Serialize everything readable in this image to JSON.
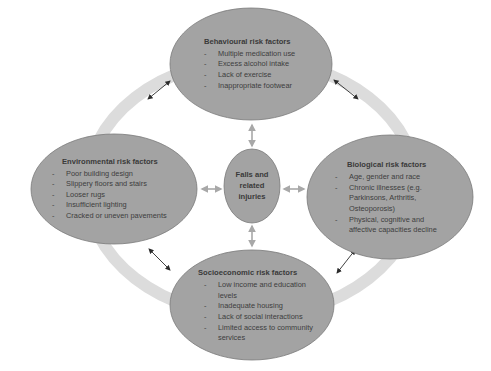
{
  "diagram": {
    "center": {
      "label_lines": [
        "Falls and",
        "related",
        "injuries"
      ]
    },
    "nodes": {
      "behavioural": {
        "title": "Behavioural risk factors",
        "items": [
          "Multiple medication use",
          "Excess alcohol intake",
          "Lack of exercise",
          "Inappropriate footwear"
        ]
      },
      "environmental": {
        "title": "Environmental risk factors",
        "items": [
          "Poor building design",
          "Slippery floors and stairs",
          "Looser rugs",
          "Insufficient lighting",
          "Cracked or uneven pavements"
        ]
      },
      "biological": {
        "title": "Biological risk factors",
        "items": [
          "Age, gender and race",
          "Chronic illnesses (e.g. Parkinsons, Arthritis, Osteoporosis)",
          "Physical, cognitive and affective capacities decline"
        ]
      },
      "socioeconomic": {
        "title": "Socioeconomic risk factors",
        "items": [
          "Low income and education levels",
          "Inadequate housing",
          "Lack of social interactions",
          "Limited access to community services"
        ]
      }
    },
    "colors": {
      "ellipse_fill": "#a3a3a3",
      "ellipse_stroke": "#7a7a7a",
      "ring": "#dcdcdc",
      "arrow_dark": "#2b2b2b",
      "arrow_light": "#a8a8a8"
    }
  }
}
